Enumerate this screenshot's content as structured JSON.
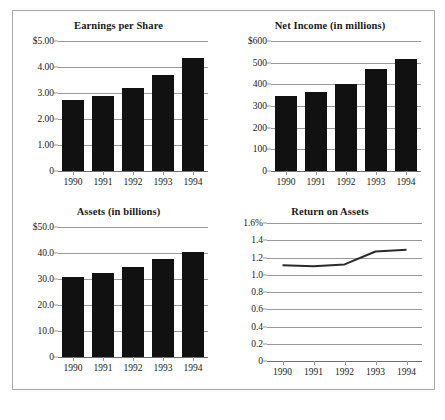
{
  "figure": {
    "background": "#ffffff",
    "border_color": "#a8a8a8",
    "bar_color": "#111111",
    "grid_color": "#9a9a9a",
    "line_color": "#2b2b2b"
  },
  "charts": [
    {
      "id": "eps",
      "title": "Earnings per Share",
      "type": "bar",
      "categories": [
        "1990",
        "1991",
        "1992",
        "1993",
        "1994"
      ],
      "values": [
        2.72,
        2.9,
        3.2,
        3.7,
        4.33
      ],
      "yticks": [
        "$5.00",
        "4.00",
        "3.00",
        "2.00",
        "1.00",
        "0"
      ],
      "ytickvalues": [
        5,
        4,
        3,
        2,
        1,
        0
      ],
      "ylim": [
        0,
        5
      ],
      "xlabel": "",
      "ylabel": ""
    },
    {
      "id": "net-income",
      "title": "Net Income (in millions)",
      "type": "bar",
      "categories": [
        "1990",
        "1991",
        "1992",
        "1993",
        "1994"
      ],
      "values": [
        348,
        365,
        402,
        472,
        515
      ],
      "yticks": [
        "$600",
        "500",
        "400",
        "300",
        "200",
        "100",
        "0"
      ],
      "ytickvalues": [
        600,
        500,
        400,
        300,
        200,
        100,
        0
      ],
      "ylim": [
        0,
        600
      ],
      "xlabel": "",
      "ylabel": ""
    },
    {
      "id": "assets",
      "title": "Assets (in billions)",
      "type": "bar",
      "categories": [
        "1990",
        "1991",
        "1992",
        "1993",
        "1994"
      ],
      "values": [
        30.8,
        32.5,
        34.6,
        37.6,
        40.5
      ],
      "yticks": [
        "$50.0",
        "40.0",
        "30.0",
        "20.0",
        "10.0",
        "0"
      ],
      "ytickvalues": [
        50,
        40,
        30,
        20,
        10,
        0
      ],
      "ylim": [
        0,
        50
      ],
      "xlabel": "",
      "ylabel": ""
    },
    {
      "id": "return-on-assets",
      "title": "Return on Assets",
      "type": "line",
      "categories": [
        "1990",
        "1991",
        "1992",
        "1993",
        "1994"
      ],
      "values": [
        1.11,
        1.1,
        1.12,
        1.27,
        1.29
      ],
      "yticks": [
        "1.6%",
        "1.4",
        "1.2",
        "1.0",
        "0.8",
        "0.6",
        "0.4",
        "0.2",
        "0"
      ],
      "ytickvalues": [
        1.6,
        1.4,
        1.2,
        1.0,
        0.8,
        0.6,
        0.4,
        0.2,
        0
      ],
      "ylim": [
        0,
        1.6
      ],
      "xlabel": "",
      "ylabel": ""
    }
  ],
  "chart_data": [
    {
      "type": "bar",
      "title": "Earnings per Share",
      "categories": [
        "1990",
        "1991",
        "1992",
        "1993",
        "1994"
      ],
      "values": [
        2.72,
        2.9,
        3.2,
        3.7,
        4.33
      ],
      "xlabel": "",
      "ylabel": "",
      "ylim": [
        0,
        5
      ],
      "ytick_labels": [
        "$5.00",
        "4.00",
        "3.00",
        "2.00",
        "1.00",
        "0"
      ],
      "grid": true,
      "legend": "none"
    },
    {
      "type": "bar",
      "title": "Net Income (in millions)",
      "categories": [
        "1990",
        "1991",
        "1992",
        "1993",
        "1994"
      ],
      "values": [
        348,
        365,
        402,
        472,
        515
      ],
      "xlabel": "",
      "ylabel": "",
      "ylim": [
        0,
        600
      ],
      "ytick_labels": [
        "$600",
        "500",
        "400",
        "300",
        "200",
        "100",
        "0"
      ],
      "grid": true,
      "legend": "none"
    },
    {
      "type": "bar",
      "title": "Assets (in billions)",
      "categories": [
        "1990",
        "1991",
        "1992",
        "1993",
        "1994"
      ],
      "values": [
        30.8,
        32.5,
        34.6,
        37.6,
        40.5
      ],
      "xlabel": "",
      "ylabel": "",
      "ylim": [
        0,
        50
      ],
      "ytick_labels": [
        "$50.0",
        "40.0",
        "30.0",
        "20.0",
        "10.0",
        "0"
      ],
      "grid": true,
      "legend": "none"
    },
    {
      "type": "line",
      "title": "Return on Assets",
      "categories": [
        "1990",
        "1991",
        "1992",
        "1993",
        "1994"
      ],
      "values": [
        1.11,
        1.1,
        1.12,
        1.27,
        1.29
      ],
      "xlabel": "",
      "ylabel": "",
      "ylim": [
        0,
        1.6
      ],
      "ytick_labels": [
        "1.6%",
        "1.4",
        "1.2",
        "1.0",
        "0.8",
        "0.6",
        "0.4",
        "0.2",
        "0"
      ],
      "grid": true,
      "legend": "none"
    }
  ]
}
